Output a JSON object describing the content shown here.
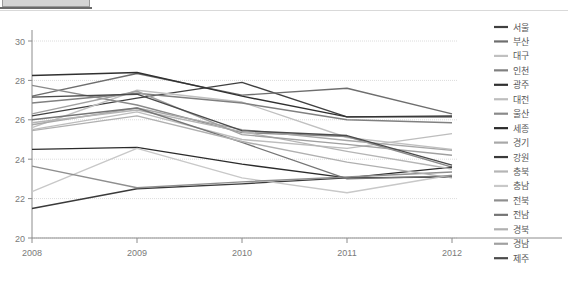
{
  "window": {
    "top_strip_present": true,
    "tab_chip_color": "#d4d4d4",
    "tab_underline_color": "#6b6b6b"
  },
  "chart_data": {
    "type": "line",
    "title": "",
    "xlabel": "",
    "ylabel": "",
    "categories": [
      "2008",
      "2009",
      "2010",
      "2011",
      "2012"
    ],
    "x": [
      2008,
      2009,
      2010,
      2011,
      2012
    ],
    "ylim": [
      20,
      30
    ],
    "yticks": [
      20,
      22,
      24,
      26,
      28,
      30
    ],
    "ytick_labels": [
      "20",
      "22",
      "24",
      "26",
      "28",
      "30"
    ],
    "grid": true,
    "grid_axis": "y",
    "legend_position": "right",
    "series": [
      {
        "name": "서울",
        "color": "#404040",
        "values": [
          26.2,
          27.1,
          27.9,
          26.15,
          26.2
        ]
      },
      {
        "name": "부산",
        "color": "#6e6e6e",
        "values": [
          27.2,
          28.35,
          27.25,
          27.6,
          26.3
        ]
      },
      {
        "name": "대구",
        "color": "#c0c0c0",
        "values": [
          25.6,
          27.5,
          26.9,
          25.1,
          24.5
        ]
      },
      {
        "name": "인천",
        "color": "#808080",
        "values": [
          26.85,
          27.35,
          26.85,
          26.0,
          25.85
        ]
      },
      {
        "name": "광주",
        "color": "#303030",
        "values": [
          28.25,
          28.4,
          27.2,
          26.15,
          26.15
        ]
      },
      {
        "name": "대전",
        "color": "#bdbdbd",
        "values": [
          25.5,
          26.4,
          25.0,
          24.55,
          25.3
        ]
      },
      {
        "name": "울산",
        "color": "#8a8a8a",
        "values": [
          27.75,
          26.75,
          25.35,
          25.15,
          23.6
        ]
      },
      {
        "name": "세종",
        "color": "#2b2b2b",
        "values": [
          24.5,
          24.6,
          23.75,
          23.05,
          23.6
        ]
      },
      {
        "name": "경기",
        "color": "#a8a8a8",
        "values": [
          25.75,
          26.6,
          25.5,
          24.95,
          24.45
        ]
      },
      {
        "name": "강원",
        "color": "#3a3a3a",
        "values": [
          21.5,
          22.5,
          22.75,
          23.05,
          23.1
        ]
      },
      {
        "name": "충북",
        "color": "#b5b5b5",
        "values": [
          25.85,
          26.5,
          25.4,
          24.4,
          23.5
        ]
      },
      {
        "name": "충남",
        "color": "#c8c8c8",
        "values": [
          22.35,
          24.55,
          23.05,
          22.3,
          23.2
        ]
      },
      {
        "name": "전북",
        "color": "#8f8f8f",
        "values": [
          23.65,
          22.55,
          22.85,
          23.1,
          23.35
        ]
      },
      {
        "name": "전남",
        "color": "#757575",
        "values": [
          26.0,
          26.6,
          24.85,
          23.0,
          23.15
        ]
      },
      {
        "name": "경북",
        "color": "#b0b0b0",
        "values": [
          25.45,
          26.2,
          24.9,
          23.85,
          23.05
        ]
      },
      {
        "name": "경남",
        "color": "#a0a0a0",
        "values": [
          26.3,
          27.45,
          25.25,
          24.75,
          24.2
        ]
      },
      {
        "name": "제주",
        "color": "#4a4a4a",
        "values": [
          27.15,
          27.3,
          25.45,
          25.2,
          23.7
        ]
      }
    ]
  },
  "plot": {
    "left": 32,
    "right": 452,
    "top": 30,
    "bottom": 227
  },
  "legend": {
    "x_swatch_start": 494,
    "x_swatch_end": 508,
    "x_text": 513,
    "y_start": 16,
    "row_height": 14.45
  }
}
